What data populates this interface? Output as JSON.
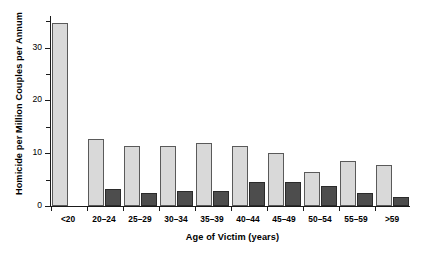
{
  "chart_data": {
    "type": "bar",
    "title": "",
    "xlabel": "Age of Victim (years)",
    "ylabel": "Homicide per Million Couples per Annum",
    "categories": [
      "<20",
      "20–24",
      "25–29",
      "30–34",
      "35–39",
      "40–44",
      "45–49",
      "50–54",
      "55–59",
      ">59"
    ],
    "series": [
      {
        "name": "light-series",
        "color": "#d9d9d9",
        "values": [
          34.6,
          12.7,
          11.3,
          11.3,
          12.0,
          11.4,
          10.1,
          6.5,
          8.6,
          7.8
        ]
      },
      {
        "name": "dark-series",
        "color": "#4d4d4d",
        "values": [
          0,
          3.3,
          2.5,
          2.9,
          2.9,
          4.5,
          4.5,
          3.7,
          2.4,
          1.7
        ]
      }
    ],
    "ylim": [
      0,
      36
    ],
    "yticks_major": [
      0,
      10,
      20,
      30
    ],
    "yticks_minor": [
      5,
      15,
      25,
      35
    ],
    "ytick_labels": [
      "0",
      "10",
      "20",
      "30"
    ],
    "grid": false,
    "legend": "none"
  }
}
